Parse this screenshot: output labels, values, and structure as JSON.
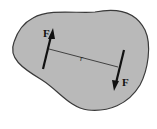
{
  "diagram": {
    "type": "couple-on-rigid-body",
    "colors": {
      "body_fill": "#b9b9b9",
      "body_stroke": "#3a3a3a",
      "arrow": "#111111",
      "background": "#ffffff"
    },
    "forces": [
      {
        "label": "F",
        "direction": "up"
      },
      {
        "label": "F",
        "direction": "down"
      }
    ],
    "distance_label": "r"
  }
}
